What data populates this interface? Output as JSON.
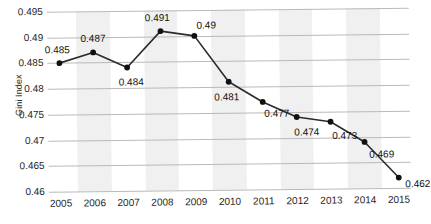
{
  "chart_data": {
    "type": "line",
    "title": "",
    "subtitle": "",
    "xlabel": "",
    "ylabel": "Gini Index",
    "categories": [
      "2005",
      "2006",
      "2007",
      "2008",
      "2009",
      "2010",
      "2011",
      "2012",
      "2013",
      "2014",
      "2015"
    ],
    "values": [
      0.485,
      0.487,
      0.484,
      0.491,
      0.49,
      0.481,
      0.477,
      0.474,
      0.473,
      0.469,
      0.462
    ],
    "point_labels": [
      "0.485",
      "0.487",
      "0.484",
      "0.491",
      "0.49",
      "0.481",
      "0.477",
      "0.474",
      "0.473",
      "0.469",
      "0.462"
    ],
    "ylim": [
      0.46,
      0.495
    ],
    "ytick_values": [
      0.495,
      0.49,
      0.485,
      0.48,
      0.475,
      0.47,
      0.465,
      0.46
    ],
    "ytick_labels": [
      "0.495",
      "0.49",
      "0.485",
      "0.48",
      "0.475",
      "0.47",
      "0.465",
      "0.46"
    ],
    "grid": true,
    "legend": false,
    "legend_position": "none",
    "marker": "circle",
    "line_color": "#2b2b2b",
    "marker_color": "#111111",
    "band_color": "#f0f0f0",
    "gridline_color": "#b9b9b9",
    "banded_categories": [
      "2006",
      "2008",
      "2010",
      "2012",
      "2014"
    ]
  }
}
